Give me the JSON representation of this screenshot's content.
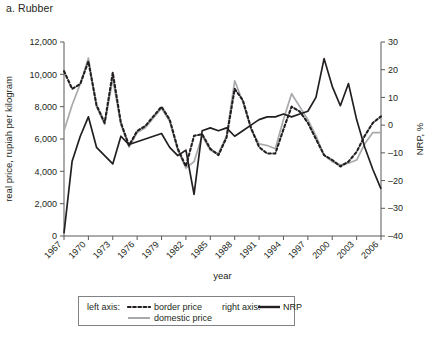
{
  "panel": {
    "title": "a. Rubber"
  },
  "legend": {
    "left_axis_label": "left axis:",
    "right_axis_label": "right axis:",
    "border_price": "border price",
    "domestic_price": "domestic price",
    "nrp": "NRP"
  },
  "colors": {
    "border_price": "#231f20",
    "domestic_price": "#a7a9ac",
    "nrp": "#231f20",
    "axis": "#58595b",
    "text": "#231f20",
    "background": "#ffffff"
  },
  "chart_data": {
    "type": "line",
    "title": "a. Rubber",
    "xlabel": "year",
    "ylabel": "real price, rupiah per kilogram",
    "y2label": "NRP, %",
    "xlim": [
      1967,
      2006
    ],
    "ylim": [
      0,
      12000
    ],
    "y2lim": [
      -40,
      30
    ],
    "grid": false,
    "legend_position": "below",
    "xticks": [
      "1967",
      "1970",
      "1973",
      "1976",
      "1979",
      "1982",
      "1985",
      "1988",
      "1991",
      "1994",
      "1997",
      "2000",
      "2003",
      "2006"
    ],
    "yticks": [
      "0",
      "2,000",
      "4,000",
      "6,000",
      "8,000",
      "10,000",
      "12,000"
    ],
    "y2ticks": [
      "-40",
      "-30",
      "-20",
      "-10",
      "0",
      "10",
      "20",
      "30"
    ],
    "x": [
      1967,
      1968,
      1969,
      1970,
      1971,
      1972,
      1973,
      1974,
      1975,
      1976,
      1977,
      1978,
      1979,
      1980,
      1981,
      1982,
      1983,
      1984,
      1985,
      1986,
      1987,
      1988,
      1989,
      1990,
      1991,
      1992,
      1993,
      1994,
      1995,
      1996,
      1997,
      1998,
      1999,
      2000,
      2001,
      2002,
      2003,
      2004,
      2005,
      2006
    ],
    "series": [
      {
        "name": "border price",
        "axis": "left",
        "style": "dotted",
        "color": "#231f20",
        "values": [
          10200,
          9100,
          9400,
          10800,
          8100,
          7000,
          10100,
          7000,
          5600,
          6500,
          6800,
          7400,
          8000,
          7200,
          5400,
          4300,
          6200,
          6300,
          5400,
          5000,
          6100,
          9100,
          8400,
          6700,
          5500,
          5100,
          5100,
          6600,
          8000,
          7700,
          7000,
          6000,
          5000,
          4700,
          4300,
          4600,
          5200,
          6200,
          7000,
          7400
        ]
      },
      {
        "name": "domestic price",
        "axis": "left",
        "style": "solid",
        "color": "#a7a9ac",
        "values": [
          6500,
          8100,
          9400,
          11000,
          8000,
          6900,
          9700,
          6900,
          5500,
          6400,
          6700,
          7300,
          7900,
          7100,
          5300,
          4200,
          4600,
          6200,
          5300,
          5100,
          6200,
          9600,
          8300,
          6600,
          5700,
          5600,
          5400,
          7200,
          8800,
          8000,
          7200,
          6200,
          5000,
          4600,
          4400,
          4500,
          4700,
          5700,
          6400,
          6400
        ]
      },
      {
        "name": "NRP",
        "axis": "right",
        "style": "solid",
        "color": "#231f20",
        "values": [
          -39,
          -13,
          -4,
          3,
          -8,
          -11,
          -14,
          -4,
          -7,
          -6,
          -5,
          -4,
          -3,
          -8,
          -11,
          -9,
          -25,
          -2,
          -1,
          -2,
          -1,
          -4,
          -2,
          0,
          2,
          3,
          3,
          4,
          3,
          4,
          5,
          10,
          24,
          14,
          7,
          15,
          2,
          -8,
          -16,
          -23
        ]
      }
    ]
  }
}
